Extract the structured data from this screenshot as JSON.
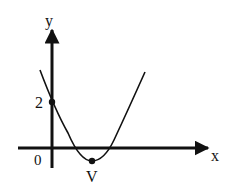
{
  "diagram": {
    "type": "parabola-graph",
    "colors": {
      "ink": "#111111",
      "background": "#ffffff"
    },
    "axes": {
      "x_label": "x",
      "y_label": "y",
      "origin_label": "0"
    },
    "points": {
      "y_intercept": {
        "label": "2",
        "value": 2
      },
      "vertex": {
        "label": "V"
      }
    },
    "curve": {
      "kind": "upward parabola",
      "y_intercept": 2,
      "x_intercepts": "two positive roots",
      "vertex_below_x_axis": true
    }
  }
}
